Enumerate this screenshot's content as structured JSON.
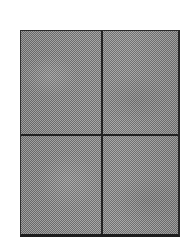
{
  "figure": {
    "type": "scanned-halftone-panel-figure",
    "caption": "",
    "background_color": "#ffffff",
    "canvas": {
      "width_px": 192,
      "height_px": 251
    },
    "frame": {
      "name": "bordered-plate",
      "left_px": 20,
      "top_px": 30,
      "width_px": 160,
      "height_px": 207,
      "border_color": "#232323",
      "border_width_px": 2,
      "fill_color": "#8a8a8a",
      "fill_pattern": "halftone-dither-checkerboard",
      "fill_light_tone": "#a6a6a6",
      "fill_dark_tone": "#6c6c6c",
      "fill_cell_px": 1
    },
    "dividers": [
      {
        "name": "vertical-divider",
        "orientation": "vertical",
        "position_px": 101,
        "thickness_px": 2,
        "color": "#232323"
      },
      {
        "name": "horizontal-divider",
        "orientation": "horizontal",
        "position_px": 134,
        "thickness_px": 2,
        "color": "#232323"
      }
    ],
    "panels": [
      {
        "id": "top-left",
        "label": "",
        "fill": "#8a8a8a"
      },
      {
        "id": "top-right",
        "label": "",
        "fill": "#8a8a8a"
      },
      {
        "id": "bottom-left",
        "label": "",
        "fill": "#8a8a8a"
      },
      {
        "id": "bottom-right",
        "label": "",
        "fill": "#8a8a8a"
      }
    ],
    "text_content": [],
    "panel_count": 4
  }
}
